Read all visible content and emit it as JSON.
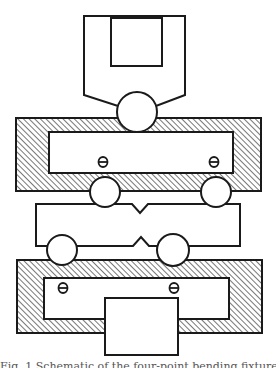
{
  "diagram": {
    "type": "mechanical-schematic",
    "colors": {
      "stroke": "#1a1a1a",
      "fill": "#ffffff",
      "hatch": "#555555"
    },
    "components": {
      "top_loading_head": {
        "label": "loading-head"
      },
      "top_load_roller": {
        "label": "upper-load-roller"
      },
      "upper_frame": {
        "label": "upper-fixture-frame",
        "hatched": true
      },
      "upper_rollers": [
        {
          "label": "upper-left-roller",
          "symbol": "ϴ"
        },
        {
          "label": "upper-right-roller",
          "symbol": "ϴ"
        }
      ],
      "specimen": {
        "label": "notched-specimen",
        "notches": [
          "top-center",
          "bottom-center"
        ]
      },
      "lower_rollers": [
        {
          "label": "lower-left-roller",
          "symbol": "ϴ"
        },
        {
          "label": "lower-right-roller",
          "symbol": "ϴ"
        }
      ],
      "lower_frame": {
        "label": "lower-fixture-frame",
        "hatched": true
      },
      "base_block": {
        "label": "base-support-block"
      }
    },
    "symbols": {
      "upper_left": "ϴ",
      "upper_right": "ϴ",
      "lower_left": "ϴ",
      "lower_right": "ϴ"
    },
    "caption": "Fig. 1  Schematic of the four-point bending fixture"
  }
}
